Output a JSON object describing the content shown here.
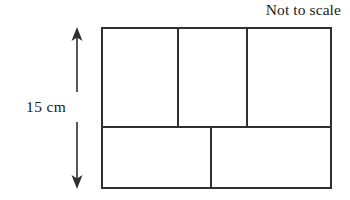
{
  "figure": {
    "title_note": "Not to scale",
    "dimension_label": "15 cm",
    "stroke_color": "#2f2f2f",
    "background_color": "#ffffff",
    "outer_rectangle": {
      "x": 102,
      "y": 28,
      "width": 229,
      "height": 160
    },
    "horizontal_divider_y": 127,
    "top_row": {
      "cells": 3,
      "divider_x": [
        178,
        247
      ]
    },
    "bottom_row": {
      "cells": 2,
      "divider_x": [
        211
      ]
    },
    "dimension_arrow": {
      "x": 77,
      "top_y": 28,
      "bottom_y": 188,
      "gap_top_y": 92,
      "gap_bottom_y": 122,
      "double_headed": true,
      "measures": "height"
    }
  }
}
